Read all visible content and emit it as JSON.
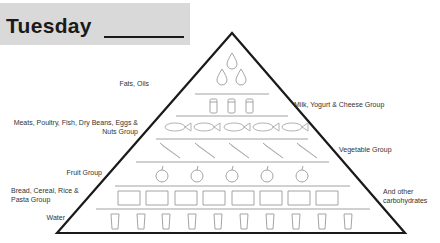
{
  "header": {
    "day": "Tuesday"
  },
  "pyramid": {
    "layers": [
      {
        "name": "Fats, Oils",
        "icon": "oil-drop-icon",
        "count": 3
      },
      {
        "name": "Milk, Yogurt & Cheese Group",
        "icon": "milk-carton-icon",
        "count": 3
      },
      {
        "name": "Meats, Poultry, Fish, Dry Beans, Eggs & Nuts Group",
        "icon": "fish-icon",
        "count": 5
      },
      {
        "name": "Vegetable Group",
        "icon": "carrot-icon",
        "count": 5
      },
      {
        "name": "Fruit Group",
        "icon": "apple-icon",
        "count": 5
      },
      {
        "name": "Bread, Cereal, Rice & Pasta Group",
        "icon": "bread-icon",
        "count": 8
      },
      {
        "name": "Water",
        "icon": "water-glass-icon",
        "count": 10
      }
    ]
  },
  "labels": {
    "fats": "Fats, Oils",
    "milk": "Milk, Yogurt & Cheese Group",
    "meats_line1": "Meats, Poultry, Fish, Dry Beans, Eggs &",
    "meats_line2": "Nuts Group",
    "vegetable": "Vegetable Group",
    "fruit": "Fruit Group",
    "bread_line1": "Bread, Cereal, Rice &",
    "bread_line2": "Pasta Group",
    "carbs_line1": "And other",
    "carbs_line2": "carbohydrates",
    "water": "Water"
  },
  "colors": {
    "header_bg": "#d9d9d9",
    "outline": "#1a1a1a",
    "icon_stroke": "#9a9a9a"
  }
}
